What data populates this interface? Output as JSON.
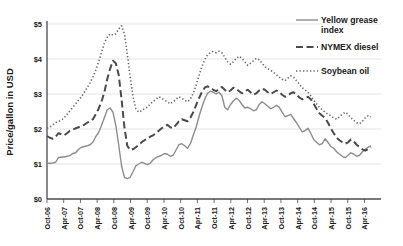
{
  "chart_data": {
    "type": "line",
    "title": "",
    "xlabel": "",
    "ylabel": "Price/gallon in USD",
    "ylim": [
      0,
      5
    ],
    "ytick_labels": [
      "$0",
      "$1",
      "$2",
      "$3",
      "$4",
      "$5"
    ],
    "ytick_values": [
      0,
      1,
      2,
      3,
      4,
      5
    ],
    "grid": true,
    "legend_position": "top-right",
    "x_tick_labels": [
      "Oct-06",
      "Apr-07",
      "Oct-07",
      "Apr-08",
      "Oct-08",
      "Apr-09",
      "Oct-09",
      "Apr-10",
      "Oct-10",
      "Apr-11",
      "Oct-11",
      "Apr-12",
      "Oct-12",
      "Apr-13",
      "Oct-13",
      "Apr-14",
      "Oct-14",
      "Apr-15",
      "Oct-15",
      "Apr-16"
    ],
    "x_start": "Oct-06",
    "x_end": "Apr-16",
    "x_interval_months": 6,
    "series": [
      {
        "name": "Yellow grease index",
        "style": "solid",
        "color": "#8c8c8c",
        "values": [
          1.02,
          1.02,
          1.03,
          1.05,
          1.18,
          1.2,
          1.2,
          1.22,
          1.24,
          1.3,
          1.32,
          1.42,
          1.48,
          1.5,
          1.52,
          1.55,
          1.62,
          1.78,
          1.9,
          2.1,
          2.32,
          2.55,
          2.6,
          2.48,
          2.1,
          1.55,
          0.95,
          0.62,
          0.58,
          0.62,
          0.78,
          0.95,
          1.0,
          1.05,
          1.02,
          0.98,
          1.02,
          1.12,
          1.18,
          1.22,
          1.25,
          1.3,
          1.28,
          1.22,
          1.25,
          1.4,
          1.55,
          1.58,
          1.52,
          1.45,
          1.58,
          1.82,
          2.05,
          2.35,
          2.62,
          2.85,
          3.02,
          3.08,
          3.05,
          3.0,
          3.05,
          2.95,
          2.62,
          2.55,
          2.7,
          2.8,
          2.88,
          2.82,
          2.7,
          2.6,
          2.62,
          2.58,
          2.52,
          2.55,
          2.7,
          2.78,
          2.72,
          2.65,
          2.58,
          2.62,
          2.68,
          2.62,
          2.48,
          2.35,
          2.38,
          2.42,
          2.3,
          2.18,
          2.05,
          1.92,
          1.95,
          2.02,
          1.88,
          1.7,
          1.62,
          1.55,
          1.58,
          1.72,
          1.62,
          1.5,
          1.45,
          1.35,
          1.28,
          1.22,
          1.18,
          1.25,
          1.32,
          1.28,
          1.22,
          1.25,
          1.35,
          1.42,
          1.48,
          1.52
        ]
      },
      {
        "name": "NYMEX diesel",
        "style": "dashed",
        "color": "#4a4a4a",
        "values": [
          1.8,
          1.75,
          1.72,
          1.78,
          1.88,
          1.85,
          1.82,
          1.88,
          1.95,
          1.98,
          2.02,
          2.05,
          2.08,
          2.12,
          2.18,
          2.22,
          2.28,
          2.42,
          2.58,
          2.78,
          3.05,
          3.42,
          3.72,
          3.95,
          3.88,
          3.55,
          2.85,
          2.05,
          1.52,
          1.4,
          1.42,
          1.48,
          1.55,
          1.62,
          1.68,
          1.72,
          1.78,
          1.82,
          1.88,
          1.95,
          2.02,
          2.08,
          2.12,
          2.05,
          2.02,
          2.12,
          2.22,
          2.28,
          2.25,
          2.22,
          2.32,
          2.48,
          2.68,
          2.88,
          3.05,
          3.18,
          3.22,
          3.18,
          3.12,
          3.08,
          3.15,
          3.2,
          3.12,
          3.05,
          3.1,
          3.18,
          3.15,
          3.08,
          3.02,
          3.08,
          3.12,
          3.05,
          2.98,
          3.02,
          3.1,
          3.15,
          3.12,
          3.05,
          3.0,
          3.05,
          3.1,
          3.05,
          2.98,
          2.92,
          2.95,
          3.02,
          3.05,
          2.98,
          2.9,
          2.85,
          2.88,
          2.92,
          2.85,
          2.72,
          2.58,
          2.45,
          2.38,
          2.32,
          2.18,
          2.02,
          1.88,
          1.75,
          1.68,
          1.62,
          1.58,
          1.62,
          1.7,
          1.65,
          1.55,
          1.48,
          1.42,
          1.38,
          1.42,
          1.48
        ]
      },
      {
        "name": "Soybean oil",
        "style": "dotted",
        "color": "#666666",
        "values": [
          2.02,
          2.05,
          2.12,
          2.18,
          2.22,
          2.25,
          2.32,
          2.42,
          2.52,
          2.62,
          2.72,
          2.82,
          2.92,
          3.05,
          3.18,
          3.32,
          3.48,
          3.68,
          3.92,
          4.18,
          4.45,
          4.62,
          4.72,
          4.68,
          4.72,
          4.85,
          4.95,
          4.72,
          4.15,
          3.48,
          2.92,
          2.58,
          2.48,
          2.52,
          2.58,
          2.62,
          2.72,
          2.78,
          2.85,
          2.92,
          2.88,
          2.82,
          2.78,
          2.72,
          2.78,
          2.85,
          2.92,
          2.88,
          2.82,
          2.78,
          2.85,
          3.02,
          3.25,
          3.52,
          3.78,
          3.98,
          4.12,
          4.18,
          4.22,
          4.18,
          4.22,
          4.18,
          4.05,
          3.92,
          3.85,
          3.92,
          4.02,
          4.08,
          4.02,
          3.92,
          3.82,
          3.88,
          3.95,
          4.02,
          3.98,
          3.88,
          3.78,
          3.72,
          3.68,
          3.62,
          3.55,
          3.48,
          3.42,
          3.38,
          3.45,
          3.52,
          3.48,
          3.38,
          3.28,
          3.18,
          3.12,
          3.05,
          2.95,
          2.82,
          2.72,
          2.62,
          2.55,
          2.48,
          2.42,
          2.38,
          2.32,
          2.28,
          2.35,
          2.42,
          2.48,
          2.42,
          2.32,
          2.25,
          2.18,
          2.15,
          2.22,
          2.32,
          2.38,
          2.35
        ]
      }
    ]
  },
  "legend": {
    "items": [
      {
        "label_line1": "Yellow grease",
        "label_line2": "index",
        "style": "solid"
      },
      {
        "label_line1": "NYMEX diesel",
        "label_line2": "",
        "style": "dashed"
      },
      {
        "label_line1": "Soybean oil",
        "label_line2": "",
        "style": "dotted"
      }
    ]
  }
}
